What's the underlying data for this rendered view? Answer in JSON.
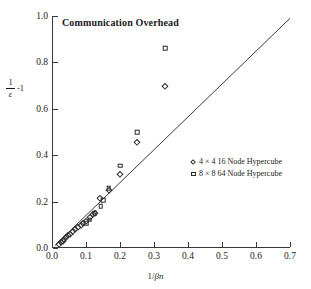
{
  "chart_data": {
    "type": "scatter",
    "title": "Communication Overhead",
    "xlabel": "1/βn",
    "xlabel_parts": {
      "prefix": "1/",
      "italic": "βn"
    },
    "ylabel": "1/ε -1",
    "ylabel_parts": {
      "numerator": "1",
      "denominator": "ε",
      "suffix": "-1"
    },
    "xlim": [
      0.0,
      0.7
    ],
    "ylim": [
      0.0,
      1.0
    ],
    "xticks": [
      "0.0",
      "0.1",
      "0.2",
      "0.3",
      "0.4",
      "0.5",
      "0.6",
      "0.7"
    ],
    "xtick_values": [
      0.0,
      0.1,
      0.2,
      0.3,
      0.4,
      0.5,
      0.6,
      0.7
    ],
    "yticks": [
      "0.0",
      "0.2",
      "0.4",
      "0.6",
      "0.8",
      "1.0"
    ],
    "ytick_values": [
      0.0,
      0.2,
      0.4,
      0.6,
      0.8,
      1.0
    ],
    "grid": false,
    "legend_position": "center-right",
    "series": [
      {
        "name": "4 × 4  16 Node Hypercube",
        "marker": "diamond",
        "color": "#2b2b2b",
        "points": [
          [
            0.02,
            0.018
          ],
          [
            0.026,
            0.026
          ],
          [
            0.031,
            0.032
          ],
          [
            0.036,
            0.04
          ],
          [
            0.042,
            0.046
          ],
          [
            0.048,
            0.055
          ],
          [
            0.054,
            0.062
          ],
          [
            0.062,
            0.072
          ],
          [
            0.069,
            0.08
          ],
          [
            0.077,
            0.09
          ],
          [
            0.084,
            0.098
          ],
          [
            0.091,
            0.107
          ],
          [
            0.1,
            0.118
          ],
          [
            0.111,
            0.132
          ],
          [
            0.12,
            0.145
          ],
          [
            0.125,
            0.152
          ],
          [
            0.14,
            0.215
          ],
          [
            0.167,
            0.25
          ],
          [
            0.2,
            0.32
          ],
          [
            0.25,
            0.455
          ],
          [
            0.333,
            0.7
          ]
        ]
      },
      {
        "name": "8 × 8  64 Node Hypercube",
        "marker": "square",
        "color": "#2b2b2b",
        "points": [
          [
            0.1,
            0.108
          ],
          [
            0.111,
            0.122
          ],
          [
            0.125,
            0.15
          ],
          [
            0.143,
            0.18
          ],
          [
            0.15,
            0.205
          ],
          [
            0.167,
            0.258
          ],
          [
            0.2,
            0.355
          ],
          [
            0.25,
            0.5
          ],
          [
            0.333,
            0.86
          ]
        ]
      }
    ],
    "reference_line": {
      "name": "ideal-reference-line",
      "from": [
        0.008,
        0.01
      ],
      "to": [
        0.7,
        0.99
      ],
      "color": "#3a3a3a"
    }
  },
  "legend": {
    "entries": [
      {
        "label": "4 × 4  16 Node Hypercube",
        "marker": "diamond"
      },
      {
        "label": "8 × 8  64 Node Hypercube",
        "marker": "square"
      }
    ]
  }
}
